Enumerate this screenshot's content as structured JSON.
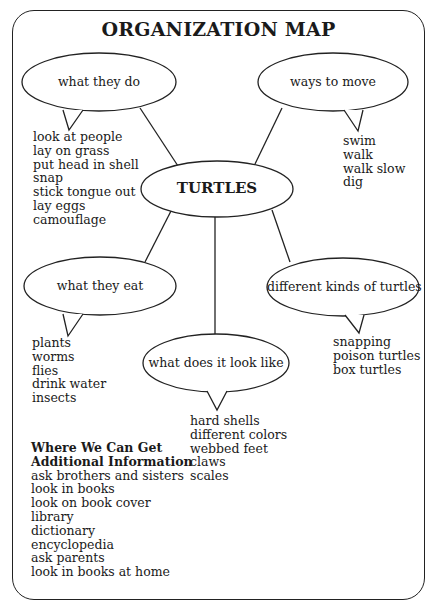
{
  "title": "ORGANIZATION MAP",
  "center": {
    "label": "TURTLES"
  },
  "nodes": [
    {
      "id": "what-they-do",
      "label": "what they do",
      "items": [
        "look at people",
        "lay on grass",
        "put head in shell",
        "snap",
        "stick tongue out",
        "lay eggs",
        "camouflage"
      ]
    },
    {
      "id": "ways-to-move",
      "label": "ways to move",
      "items": [
        "swim",
        "walk",
        "walk slow",
        "dig"
      ]
    },
    {
      "id": "what-they-eat",
      "label": "what they eat",
      "items": [
        "plants",
        "worms",
        "flies",
        "drink water",
        "insects"
      ]
    },
    {
      "id": "different-kinds",
      "label": "different kinds of turtles",
      "items": [
        "snapping",
        "poison turtles",
        "box turtles"
      ]
    },
    {
      "id": "look-like",
      "label": "what does it look like",
      "items": [
        "hard shells",
        "different colors",
        "webbed feet",
        "claws",
        "scales"
      ]
    }
  ],
  "info": {
    "heading_line1": "Where We Can Get",
    "heading_line2": "Additional Information",
    "items": [
      "ask brothers and sisters",
      "look in books",
      "look on book cover",
      "library",
      "dictionary",
      "encyclopedia",
      "ask parents",
      "look in books at home"
    ]
  }
}
